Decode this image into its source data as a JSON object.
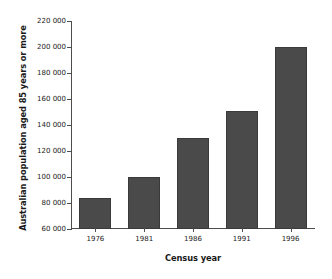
{
  "chart_data": {
    "type": "bar",
    "title": "",
    "xlabel": "Census year",
    "ylabel": "Australian population aged 85 years or more",
    "categories": [
      "1976",
      "1981",
      "1986",
      "1991",
      "1996"
    ],
    "values": [
      84000,
      100000,
      130000,
      151000,
      200000
    ],
    "ylim": [
      60000,
      220000
    ],
    "yticks": [
      60000,
      80000,
      100000,
      120000,
      140000,
      160000,
      180000,
      200000,
      220000
    ],
    "ytick_labels": [
      "60 000",
      "80 000",
      "100 000",
      "120 000",
      "140 000",
      "160 000",
      "180 000",
      "200 000",
      "220 000"
    ],
    "grid": false,
    "legend": null,
    "bar_color": "#4a4a4a",
    "axis_color": "#4d4d4d",
    "background_color": "#ffffff"
  }
}
